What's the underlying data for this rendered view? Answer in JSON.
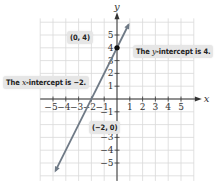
{
  "chart_data": {
    "type": "line",
    "title": "",
    "xlabel": "x",
    "ylabel": "y",
    "xlim": [
      -6,
      6
    ],
    "ylim": [
      -6.4,
      6.3
    ],
    "grid": true,
    "x_ticks": [
      -5,
      -4,
      -3,
      -2,
      -1,
      1,
      2,
      3,
      4,
      5
    ],
    "y_ticks": [
      -5,
      -4,
      -3,
      -1,
      1,
      2,
      3,
      4,
      5
    ],
    "series": [
      {
        "name": "y = 2x + 4",
        "equation": "y = 2x + 4",
        "x": [
          -4.8,
          0.9
        ],
        "y": [
          -5.6,
          5.8
        ],
        "color": "#6f7a86",
        "arrows": "both"
      }
    ],
    "points": [
      {
        "x": 0,
        "y": 4,
        "label": "(0, 4)",
        "marker": "filled-dot"
      },
      {
        "x": -2,
        "y": 0,
        "label": "(−2, 0)",
        "marker": "none"
      }
    ],
    "annotations": [
      {
        "text_before": "The ",
        "var": "y",
        "text_after": "-intercept is 4.",
        "points_to": [
          0,
          4
        ]
      },
      {
        "text_before": "The ",
        "var": "x",
        "text_after": "-intercept is −2.",
        "points_to": [
          -2,
          0
        ]
      }
    ]
  },
  "labels": {
    "point_0_4": "(0, 4)",
    "point_neg2_0": "(−2, 0)",
    "y_intercept_pre": "The ",
    "y_intercept_var": "y",
    "y_intercept_post": "-intercept is 4.",
    "x_intercept_pre": "The ",
    "x_intercept_var": "x",
    "x_intercept_post": "-intercept is −2."
  },
  "colors": {
    "grid": "#d9d9d9",
    "axis": "#333333",
    "line": "#6f7a86",
    "callout_bg": "#e6e6e6"
  }
}
